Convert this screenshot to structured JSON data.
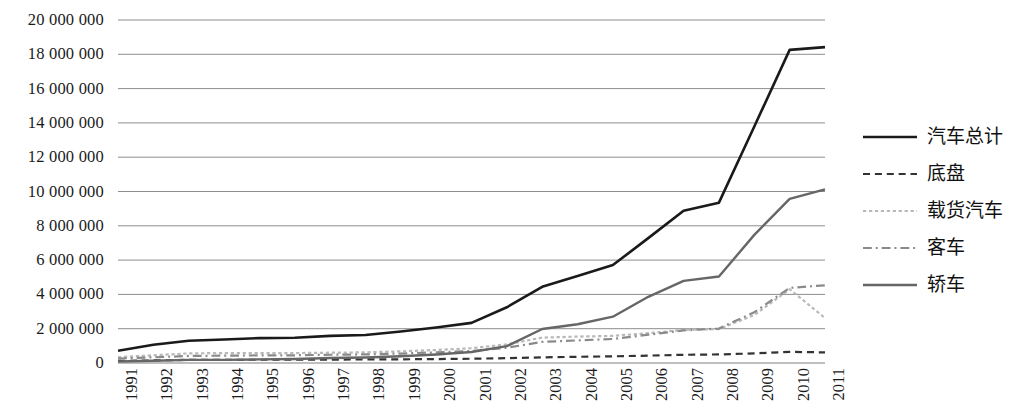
{
  "chart_data": {
    "type": "line",
    "title": "",
    "xlabel": "",
    "ylabel": "",
    "x": [
      1991,
      1992,
      1993,
      1994,
      1995,
      1996,
      1997,
      1998,
      1999,
      2000,
      2001,
      2002,
      2003,
      2004,
      2005,
      2006,
      2007,
      2008,
      2009,
      2010,
      2011
    ],
    "categories": [
      "1991",
      "1992",
      "1993",
      "1994",
      "1995",
      "1996",
      "1997",
      "1998",
      "1999",
      "2000",
      "2001",
      "2002",
      "2003",
      "2004",
      "2005",
      "2006",
      "2007",
      "2008",
      "2009",
      "2010",
      "2011"
    ],
    "ylim": [
      0,
      20000000
    ],
    "ytick_values": [
      0,
      2000000,
      4000000,
      6000000,
      8000000,
      10000000,
      12000000,
      14000000,
      16000000,
      18000000,
      20000000
    ],
    "ytick_labels": [
      "0",
      "2 000 000",
      "4 000 000",
      "6 000 000",
      "8 000 000",
      "10 000 000",
      "12 000 000",
      "14 000 000",
      "16 000 000",
      "18 000 000",
      "20 000 000"
    ],
    "grid": true,
    "grid_axis": "y",
    "legend_position": "right",
    "series": [
      {
        "name": "汽车总计",
        "style": "solid",
        "color": "#1a1a1a",
        "width": 2.6,
        "values": [
          710000,
          1060000,
          1297000,
          1367000,
          1452000,
          1475000,
          1583000,
          1630000,
          1832000,
          2070000,
          2340000,
          3250000,
          4440000,
          5070000,
          5710000,
          7280000,
          8880000,
          9350000,
          13790000,
          18260000,
          18420000
        ]
      },
      {
        "name": "底盘",
        "style": "dashed",
        "color": "#333333",
        "width": 2.2,
        "values": [
          120000,
          150000,
          180000,
          185000,
          190000,
          195000,
          200000,
          205000,
          215000,
          230000,
          250000,
          280000,
          330000,
          360000,
          390000,
          430000,
          480000,
          500000,
          560000,
          650000,
          620000
        ]
      },
      {
        "name": "载货汽车",
        "style": "dotted",
        "color": "#b9b9b9",
        "width": 2.2,
        "values": [
          340000,
          450000,
          560000,
          580000,
          570000,
          580000,
          600000,
          620000,
          680000,
          760000,
          860000,
          1090000,
          1480000,
          1540000,
          1580000,
          1740000,
          1930000,
          1980000,
          2800000,
          4300000,
          2620000
        ]
      },
      {
        "name": "客车",
        "style": "dashdot",
        "color": "#8a8a8a",
        "width": 2.2,
        "values": [
          260000,
          330000,
          410000,
          430000,
          440000,
          450000,
          480000,
          500000,
          550000,
          620000,
          700000,
          890000,
          1230000,
          1320000,
          1400000,
          1650000,
          1900000,
          2010000,
          2960000,
          4380000,
          4530000
        ]
      },
      {
        "name": "轿车",
        "style": "solid",
        "color": "#666666",
        "width": 2.4,
        "values": [
          90000,
          130000,
          180000,
          180000,
          210000,
          230000,
          290000,
          320000,
          390000,
          500000,
          640000,
          980000,
          1980000,
          2260000,
          2700000,
          3860000,
          4790000,
          5040000,
          7470000,
          9570000,
          10120000
        ]
      }
    ]
  },
  "legend": {
    "items": [
      {
        "label": "汽车总计"
      },
      {
        "label": "底盘"
      },
      {
        "label": "载货汽车"
      },
      {
        "label": "客车"
      },
      {
        "label": "轿车"
      }
    ]
  },
  "colors": {
    "gridline": "#808080",
    "axis": "#555555",
    "background": "#ffffff"
  }
}
